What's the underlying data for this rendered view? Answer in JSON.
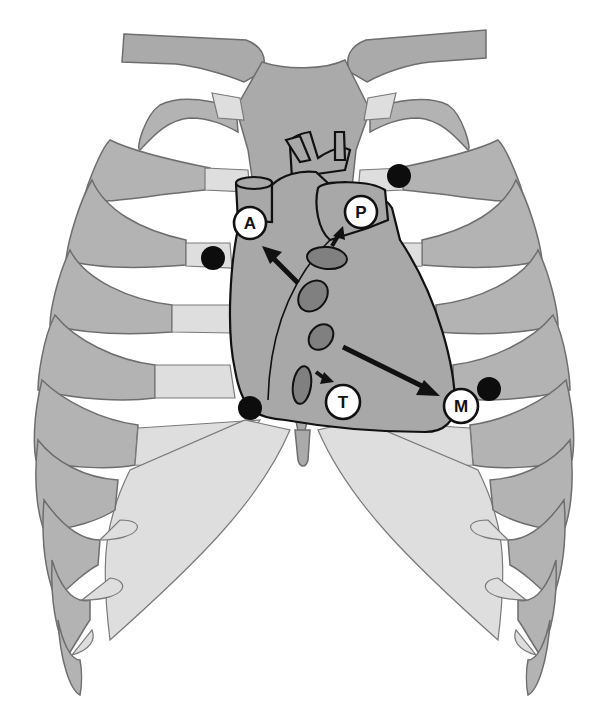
{
  "diagram": {
    "colors": {
      "background": "#ffffff",
      "rib": "#b3b3b3",
      "cartilage": "#dedede",
      "heart": "#a8a8a8",
      "valve": "#808080",
      "outline": "#111111",
      "marker_dot": "#0d0d0d"
    },
    "labels": [
      {
        "id": "A",
        "text": "A",
        "meaning": "aortic area",
        "x": 250,
        "y": 223
      },
      {
        "id": "P",
        "text": "P",
        "meaning": "pulmonic area",
        "x": 361,
        "y": 212
      },
      {
        "id": "T",
        "text": "T",
        "meaning": "tricuspid area",
        "x": 343,
        "y": 402
      },
      {
        "id": "M",
        "text": "M",
        "meaning": "mitral area",
        "x": 461,
        "y": 406
      }
    ],
    "markers": [
      {
        "name": "aortic-dot",
        "x": 213,
        "y": 258
      },
      {
        "name": "pulmonic-dot",
        "x": 399,
        "y": 176
      },
      {
        "name": "tricuspid-dot",
        "x": 250,
        "y": 408
      },
      {
        "name": "mitral-dot",
        "x": 489,
        "y": 389
      }
    ],
    "arrows": [
      {
        "from": "aortic-valve",
        "to": "A"
      },
      {
        "from": "pulmonic-valve",
        "to": "P"
      },
      {
        "from": "tricuspid-valve",
        "to": "T"
      },
      {
        "from": "mitral-valve",
        "to": "M"
      }
    ]
  }
}
